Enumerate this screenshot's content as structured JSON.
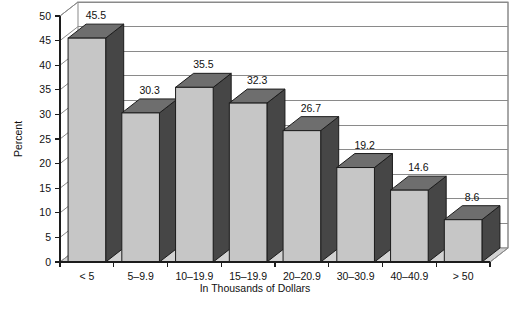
{
  "chart_data": {
    "type": "bar",
    "title": "",
    "subtitle": "",
    "xlabel": "In Thousands of Dollars",
    "ylabel": "Percent",
    "categories": [
      "< 5",
      "5–9.9",
      "10–19.9",
      "15–19.9",
      "20–20.9",
      "30–30.9",
      "40–40.9",
      "> 50"
    ],
    "values": [
      45.5,
      30.3,
      35.5,
      32.3,
      26.7,
      19.2,
      14.6,
      8.6
    ],
    "value_labels": [
      "45.5",
      "30.3",
      "35.5",
      "32.3",
      "26.7",
      "19.2",
      "14.6",
      "8.6"
    ],
    "ylim": [
      0,
      50
    ],
    "ytick_step": 5,
    "ytick_labels": [
      "50",
      "45",
      "40",
      "35",
      "30",
      "25",
      "20",
      "15",
      "10",
      "5",
      "0"
    ],
    "ytick_values": [
      50,
      45,
      40,
      35,
      30,
      25,
      20,
      15,
      10,
      5,
      0
    ],
    "grid": true,
    "grid_axis": "y",
    "legend": false,
    "legend_position": "none",
    "style": "3d-column",
    "colors": {
      "bar_front": "#c6c6c6",
      "bar_side": "#464646",
      "bar_top": "#6e6e6e",
      "floor": "#d2d2d2",
      "wall": "#ffffff",
      "gridline": "#8a8a8a",
      "axis": "#1c1c1c",
      "text": "#111111",
      "background": "#ffffff"
    }
  },
  "geometry": {
    "plot_left": 60,
    "plot_right": 490,
    "plot_top": 16,
    "plot_bottom": 262,
    "depth_x": 18,
    "depth_y": 14,
    "bar_count": 8
  }
}
